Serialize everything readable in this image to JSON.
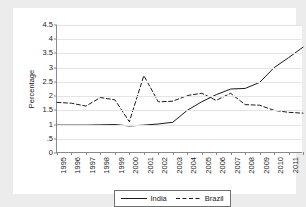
{
  "chart_data": {
    "type": "line",
    "title": "",
    "xlabel": "",
    "ylabel": "Percentage",
    "grid": true,
    "legend_position": "bottom",
    "xlim": [
      1995,
      2012
    ],
    "ylim": [
      0,
      4.5
    ],
    "x": [
      1995,
      1996,
      1997,
      1998,
      1999,
      2000,
      2001,
      2002,
      2003,
      2004,
      2005,
      2006,
      2007,
      2008,
      2009,
      2010,
      2011,
      2012
    ],
    "categories": [
      "1995",
      "1996",
      "1997",
      "1998",
      "1999",
      "2000",
      "2001",
      "2002",
      "2003",
      "2004",
      "2005",
      "2006",
      "2007",
      "2008",
      "2009",
      "2010",
      "2011",
      "2012"
    ],
    "ytick_labels": [
      "0",
      ".5",
      "1",
      "1.5",
      "2",
      "2.5",
      "3",
      "3.5",
      "4",
      "4.5"
    ],
    "ytick_values": [
      0,
      0.5,
      1,
      1.5,
      2,
      2.5,
      3,
      3.5,
      4,
      4.5
    ],
    "series": [
      {
        "name": "India",
        "style": "solid",
        "color": "#1a1a1a",
        "values": [
          0.98,
          0.98,
          0.98,
          0.99,
          1.0,
          0.95,
          0.98,
          1.02,
          1.08,
          1.5,
          1.8,
          2.05,
          2.25,
          2.27,
          2.48,
          3.0,
          3.35,
          3.72
        ]
      },
      {
        "name": "Brazil",
        "style": "dashed",
        "color": "#1a1a1a",
        "values": [
          1.78,
          1.75,
          1.65,
          1.95,
          1.87,
          1.1,
          2.72,
          1.8,
          1.82,
          2.02,
          2.1,
          1.85,
          2.1,
          1.7,
          1.68,
          1.5,
          1.43,
          1.4
        ]
      }
    ]
  },
  "legend": {
    "entries": [
      {
        "label": "India",
        "style": "solid"
      },
      {
        "label": "Brazil",
        "style": "dashed"
      }
    ]
  }
}
